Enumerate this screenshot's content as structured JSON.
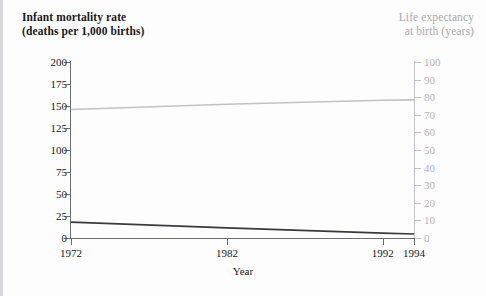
{
  "figure": {
    "width": 486,
    "height": 296,
    "background": "#fdfdfd"
  },
  "titles": {
    "left": "Infant mortality rate\n(deaths per 1,000 births)",
    "right": "Life expectancy\nat birth (years)"
  },
  "colors": {
    "left_axis": "#1a1a1a",
    "right_axis": "#b4b4b8",
    "infant_mortality_line": "#3a3a3e",
    "life_expectancy_line": "#c2c2c6",
    "background": "#fdfdfd",
    "edge_rule": "#d8d8da"
  },
  "chart_data": {
    "type": "line",
    "title": "",
    "xlabel": "Year",
    "xlim": [
      1972,
      1994
    ],
    "xticks": [
      1972,
      1982,
      1992,
      1994
    ],
    "xticklabels": [
      "1972",
      "1982",
      "1992",
      "1994"
    ],
    "grid": false,
    "legend": "none",
    "axes": [
      {
        "side": "left",
        "ylabel": "Infant mortality rate (deaths per 1,000 births)",
        "ylim": [
          0,
          200
        ],
        "yticks": [
          0,
          25,
          50,
          75,
          100,
          125,
          150,
          175,
          200
        ],
        "yticklabels": [
          "0",
          "25",
          "50",
          "75",
          "100",
          "125",
          "150",
          "175",
          "200"
        ],
        "color": "#1a1a1a"
      },
      {
        "side": "right",
        "ylabel": "Life expectancy at birth (years)",
        "ylim": [
          0,
          100
        ],
        "yticks": [
          0,
          10,
          20,
          30,
          40,
          50,
          60,
          70,
          80,
          90,
          100
        ],
        "yticklabels": [
          "0",
          "10",
          "20",
          "30",
          "40",
          "50",
          "60",
          "70",
          "80",
          "90",
          "100"
        ],
        "color": "#b4b4b8"
      }
    ],
    "series": [
      {
        "name": "Infant mortality rate",
        "axis": "left",
        "units": "deaths per 1,000 births",
        "color": "#3a3a3e",
        "x": [
          1972,
          1982,
          1992,
          1994
        ],
        "values": [
          18,
          11.5,
          5.5,
          4.5
        ]
      },
      {
        "name": "Life expectancy at birth",
        "axis": "right",
        "units": "years",
        "color": "#c2c2c6",
        "x": [
          1972,
          1982,
          1992,
          1994
        ],
        "values": [
          73.0,
          76.0,
          78.3,
          78.5
        ]
      }
    ]
  }
}
